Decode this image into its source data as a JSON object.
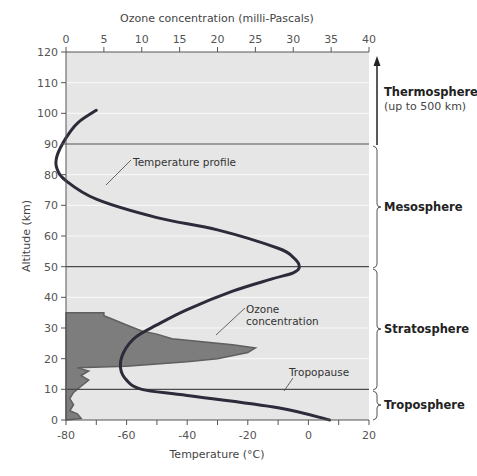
{
  "chart_data": {
    "type": "line",
    "title": "",
    "xlabel": "Temperature (°C)",
    "x2label": "Ozone concentration (milli-Pascals)",
    "ylabel": "Altitude (km)",
    "xlim": [
      -80,
      20
    ],
    "x2lim": [
      0,
      40
    ],
    "ylim": [
      0,
      120
    ],
    "x_ticks": [
      "-80",
      "-60",
      "-40",
      "-20",
      "0",
      "20"
    ],
    "x2_ticks": [
      "0",
      "5",
      "10",
      "15",
      "20",
      "25",
      "30",
      "35",
      "40"
    ],
    "y_ticks": [
      "0",
      "10",
      "20",
      "30",
      "40",
      "50",
      "60",
      "70",
      "80",
      "90",
      "100",
      "110",
      "120"
    ],
    "grid": "horizontal every 10 km (white lines)",
    "series": [
      {
        "name": "Temperature profile",
        "axis": "temperature",
        "points": [
          [
            7,
            0
          ],
          [
            -10,
            4
          ],
          [
            -40,
            8
          ],
          [
            -55,
            10
          ],
          [
            -60,
            13
          ],
          [
            -62,
            17
          ],
          [
            -61,
            22
          ],
          [
            -57,
            27
          ],
          [
            -50,
            31
          ],
          [
            -40,
            36
          ],
          [
            -25,
            42
          ],
          [
            -12,
            46
          ],
          [
            -5,
            48
          ],
          [
            -3,
            50
          ],
          [
            -5,
            53
          ],
          [
            -10,
            56
          ],
          [
            -30,
            62
          ],
          [
            -50,
            66
          ],
          [
            -70,
            72
          ],
          [
            -80,
            78
          ],
          [
            -83,
            82
          ],
          [
            -83,
            86
          ],
          [
            -80,
            92
          ],
          [
            -76,
            97
          ],
          [
            -70,
            101
          ]
        ]
      },
      {
        "name": "Ozone concentration",
        "axis": "ozone",
        "type": "area",
        "points": [
          [
            0,
            0
          ],
          [
            2,
            0.5
          ],
          [
            1.5,
            2
          ],
          [
            0.5,
            3
          ],
          [
            1,
            5
          ],
          [
            0.5,
            7
          ],
          [
            1,
            9
          ],
          [
            2,
            11
          ],
          [
            3,
            13
          ],
          [
            2,
            14.5
          ],
          [
            3,
            16
          ],
          [
            1.5,
            17
          ],
          [
            8,
            17.5
          ],
          [
            16,
            19
          ],
          [
            20,
            20
          ],
          [
            24,
            22
          ],
          [
            25,
            23.5
          ],
          [
            22,
            24.5
          ],
          [
            18,
            25.5
          ],
          [
            14,
            26.5
          ],
          [
            12,
            28
          ],
          [
            10,
            29
          ],
          [
            8,
            31
          ],
          [
            6,
            33
          ],
          [
            5,
            34
          ],
          [
            5,
            35
          ],
          [
            0,
            35
          ]
        ]
      }
    ],
    "annotations": [
      {
        "text": "Temperature profile",
        "target": "temperature curve at ~75 km"
      },
      {
        "text": "Ozone concentration",
        "target": "ozone area at ~27 km"
      },
      {
        "text": "Tropopause",
        "target": "line at 10 km"
      }
    ],
    "layers": [
      {
        "name": "Thermosphere",
        "note": "(up to 500 km)",
        "range": [
          90,
          120
        ]
      },
      {
        "name": "Mesosphere",
        "range": [
          50,
          90
        ]
      },
      {
        "name": "Stratosphere",
        "range": [
          10,
          50
        ]
      },
      {
        "name": "Troposphere",
        "range": [
          0,
          10
        ]
      }
    ],
    "boundary_lines_km": [
      10,
      50,
      90
    ]
  },
  "labels": {
    "ozone_axis_title": "Ozone concentration (milli-Pascals)",
    "temp_axis_title": "Temperature (°C)",
    "alt_axis_title": "Altitude (km)",
    "temperature_profile": "Temperature profile",
    "ozone_line1": "Ozone",
    "ozone_line2": "concentration",
    "tropopause": "Tropopause",
    "thermosphere": "Thermosphere",
    "thermosphere_note": "(up to 500 km)",
    "mesosphere": "Mesosphere",
    "stratosphere": "Stratosphere",
    "troposphere": "Troposphere"
  },
  "colors": {
    "plot_bg": "#e6e6e6",
    "ozone_fill": "#7d7d7d",
    "ozone_edge": "#5f5f5f",
    "temp_curve": "#2b2b3a",
    "boundary_line": "#4a4a4a",
    "grid_line": "#f7f7f7"
  }
}
